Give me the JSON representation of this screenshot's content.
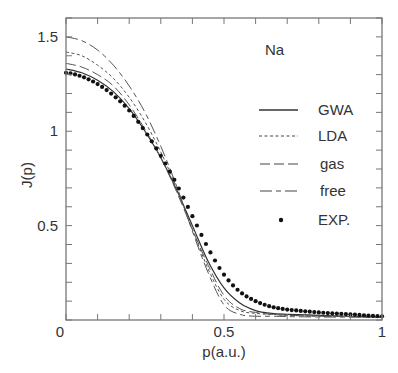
{
  "chart_data": {
    "type": "line",
    "title": "",
    "annotation": "Na",
    "xlabel": "p(a.u.)",
    "ylabel": "J(p)",
    "xlim": [
      0,
      1
    ],
    "ylim": [
      0,
      1.6
    ],
    "xticks": [
      0,
      0.5,
      1
    ],
    "xtick_labels": [
      "0",
      "0.5",
      "1"
    ],
    "yticks": [
      0,
      0.5,
      1,
      1.5
    ],
    "ytick_labels": [
      "0",
      "0.5",
      "1",
      "1.5"
    ],
    "x_minor_step": 0.1,
    "y_minor_step": 0.1,
    "grid": false,
    "legend_position": "upper right (inside)",
    "x": [
      0,
      0.05,
      0.1,
      0.15,
      0.2,
      0.25,
      0.3,
      0.35,
      0.4,
      0.45,
      0.5,
      0.55,
      0.6,
      0.65,
      0.7,
      0.8,
      0.9,
      1.0
    ],
    "series": [
      {
        "name": "GWA",
        "style": "solid",
        "values": [
          1.33,
          1.31,
          1.27,
          1.21,
          1.12,
          1.0,
          0.86,
          0.69,
          0.5,
          0.31,
          0.17,
          0.09,
          0.05,
          0.035,
          0.03,
          0.025,
          0.02,
          0.015
        ]
      },
      {
        "name": "LDA",
        "style": "dashed-short",
        "values": [
          1.42,
          1.4,
          1.35,
          1.28,
          1.18,
          1.05,
          0.89,
          0.7,
          0.48,
          0.27,
          0.11,
          0.05,
          0.035,
          0.03,
          0.025,
          0.02,
          0.018,
          0.015
        ]
      },
      {
        "name": "gas",
        "style": "dashed-long",
        "values": [
          1.36,
          1.34,
          1.3,
          1.24,
          1.14,
          1.01,
          0.86,
          0.68,
          0.48,
          0.29,
          0.13,
          0.06,
          0.04,
          0.03,
          0.025,
          0.02,
          0.018,
          0.015
        ]
      },
      {
        "name": "free",
        "style": "dash-dot",
        "values": [
          1.5,
          1.48,
          1.43,
          1.35,
          1.24,
          1.1,
          0.92,
          0.71,
          0.47,
          0.25,
          0.08,
          0.03,
          0.02,
          0.02,
          0.018,
          0.016,
          0.015,
          0.013
        ]
      },
      {
        "name": "EXP.",
        "style": "dots",
        "values": [
          1.31,
          1.29,
          1.25,
          1.19,
          1.11,
          1.0,
          0.87,
          0.72,
          0.55,
          0.38,
          0.24,
          0.15,
          0.1,
          0.07,
          0.055,
          0.04,
          0.03,
          0.02
        ]
      }
    ]
  },
  "legend": {
    "items": [
      {
        "label": "GWA"
      },
      {
        "label": "LDA"
      },
      {
        "label": "gas"
      },
      {
        "label": "free"
      },
      {
        "label": "EXP."
      }
    ]
  }
}
